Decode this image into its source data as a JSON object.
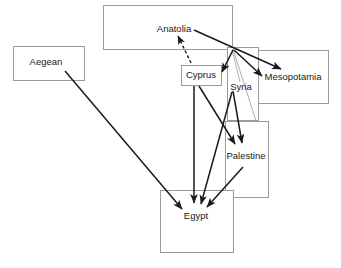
{
  "diagram": {
    "canvas": {
      "width": 341,
      "height": 268
    },
    "style": {
      "box_stroke": "#9a9a9a",
      "box_fill": "#ffffff",
      "arrow_color": "#1a1a1a",
      "faint_line_color": "#9a9a9a",
      "label_color": "#1a1a1a",
      "background": "#ffffff"
    },
    "nodes": [
      {
        "id": "anatolia",
        "label": "Anatolia",
        "box": {
          "x": 103,
          "y": 5,
          "w": 129,
          "h": 44
        },
        "label_pos": {
          "x": 174,
          "y": 29
        }
      },
      {
        "id": "aegean",
        "label": "Aegean",
        "box": {
          "x": 13,
          "y": 46,
          "w": 71,
          "h": 34
        },
        "label_pos": {
          "x": 46,
          "y": 62
        }
      },
      {
        "id": "mesopotamia",
        "label": "Mesopotamia",
        "box": {
          "x": 253,
          "y": 50,
          "w": 75,
          "h": 53
        },
        "label_pos": {
          "x": 293,
          "y": 77
        }
      },
      {
        "id": "cyprus",
        "label": "Cyprus",
        "box": {
          "x": 181,
          "y": 65,
          "w": 40,
          "h": 20
        },
        "label_pos": {
          "x": 201,
          "y": 75
        }
      },
      {
        "id": "syria",
        "label": "Syria",
        "box": {
          "x": 227,
          "y": 47,
          "w": 31,
          "h": 73
        },
        "label_pos": {
          "x": 241,
          "y": 87
        }
      },
      {
        "id": "palestine",
        "label": "Palestine",
        "box": {
          "x": 225,
          "y": 121,
          "w": 43,
          "h": 76
        },
        "label_pos": {
          "x": 246,
          "y": 156
        }
      },
      {
        "id": "egypt",
        "label": "Egypt",
        "box": {
          "x": 160,
          "y": 190,
          "w": 73,
          "h": 62
        },
        "label_pos": {
          "x": 196,
          "y": 216
        }
      }
    ],
    "edges": [
      {
        "id": "anatolia-to-mesopotamia",
        "from": "anatolia",
        "to": "mesopotamia",
        "style": "solid",
        "arrow": "end"
      },
      {
        "id": "hub-to-mesopotamia",
        "from": "syria",
        "to": "mesopotamia",
        "style": "solid",
        "arrow": "end"
      },
      {
        "id": "hub-to-cyprus",
        "from": "syria",
        "to": "cyprus",
        "style": "solid",
        "arrow": "end"
      },
      {
        "id": "hub-to-syria-faint",
        "from": "anatolia",
        "to": "syria",
        "style": "faint",
        "arrow": "none"
      },
      {
        "id": "hub-to-palestine-faint",
        "from": "anatolia",
        "to": "palestine",
        "style": "faint",
        "arrow": "none"
      },
      {
        "id": "cyprus-to-anatolia",
        "from": "cyprus",
        "to": "anatolia",
        "style": "dashed",
        "arrow": "end"
      },
      {
        "id": "cyprus-to-palestine",
        "from": "cyprus",
        "to": "palestine",
        "style": "solid",
        "arrow": "end"
      },
      {
        "id": "cyprus-to-egypt",
        "from": "cyprus",
        "to": "egypt",
        "style": "solid",
        "arrow": "end"
      },
      {
        "id": "syria-to-palestine",
        "from": "syria",
        "to": "palestine",
        "style": "solid",
        "arrow": "end"
      },
      {
        "id": "syria-to-egypt",
        "from": "syria",
        "to": "egypt",
        "style": "solid",
        "arrow": "end"
      },
      {
        "id": "palestine-to-egypt",
        "from": "palestine",
        "to": "egypt",
        "style": "solid",
        "arrow": "end"
      },
      {
        "id": "aegean-to-egypt",
        "from": "aegean",
        "to": "egypt",
        "style": "solid",
        "arrow": "end"
      }
    ]
  }
}
